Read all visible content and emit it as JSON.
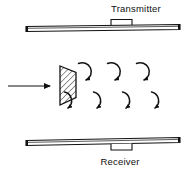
{
  "figure": {
    "type": "vortex-shedding-flowmeter-diagram",
    "background_color": "#ffffff",
    "line_color": "#111111",
    "hatch_color": "#111111",
    "width": 191,
    "height": 171
  },
  "labels": {
    "transmitter": "Transmitter",
    "receiver": "Receiver"
  },
  "transmitter": {
    "label": "Transmitter",
    "label_x": 136,
    "label_y": 12,
    "bar": {
      "x": 26,
      "y": 25,
      "width": 154,
      "height": 5
    },
    "tab": {
      "x": 111,
      "y": 19,
      "width": 21,
      "height": 6
    }
  },
  "receiver": {
    "label": "Receiver",
    "label_x": 120,
    "label_y": 165,
    "bar": {
      "x": 26,
      "y": 139,
      "width": 154,
      "height": 5
    },
    "tab": {
      "x": 111,
      "y": 144,
      "width": 21,
      "height": 6
    }
  },
  "flow_arrow": {
    "name": "flow-direction-arrow",
    "x1": 8,
    "y1": 86,
    "x2": 52,
    "y2": 86
  },
  "bluff_body": {
    "name": "hatched-bluff-body-wedge",
    "hatched": true,
    "points": "60,66 76,72 76,98 60,105",
    "hatch_spacing": 4.2
  },
  "vortices": {
    "upper_row": [
      {
        "cx": 85,
        "cy": 72
      },
      {
        "cx": 114,
        "cy": 72
      },
      {
        "cx": 143,
        "cy": 72
      }
    ],
    "lower_row": [
      {
        "cx": 71,
        "cy": 99
      },
      {
        "cx": 100,
        "cy": 99
      },
      {
        "cx": 129,
        "cy": 99
      },
      {
        "cx": 158,
        "cy": 99
      }
    ],
    "radius": 9,
    "count_upper": 3,
    "count_lower": 4
  }
}
